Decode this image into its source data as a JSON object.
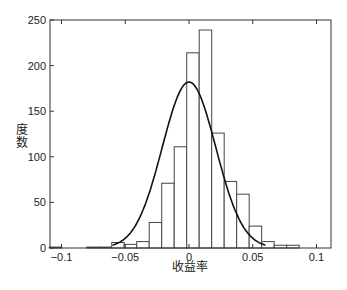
{
  "chart_data": {
    "type": "bar",
    "subtype": "histogram_with_normal_fit",
    "title": "",
    "xlabel": "收益率",
    "ylabel": "度数",
    "xlim": [
      -0.11,
      0.11
    ],
    "ylim": [
      0,
      250
    ],
    "xticks": [
      -0.1,
      -0.05,
      0,
      0.05,
      0.1
    ],
    "xtick_labels": [
      "−0.1",
      "−0.05",
      "0",
      "0.05",
      "0.1"
    ],
    "yticks": [
      0,
      50,
      100,
      150,
      200,
      250
    ],
    "ytick_labels": [
      "0",
      "50",
      "100",
      "150",
      "200",
      "250"
    ],
    "grid": false,
    "bin_width": 0.0098,
    "bins": [
      {
        "center": -0.1047,
        "count": 1
      },
      {
        "center": -0.0753,
        "count": 1
      },
      {
        "center": -0.0655,
        "count": 1
      },
      {
        "center": -0.0557,
        "count": 6
      },
      {
        "center": -0.0459,
        "count": 4
      },
      {
        "center": -0.0361,
        "count": 7
      },
      {
        "center": -0.0263,
        "count": 28
      },
      {
        "center": -0.0165,
        "count": 71
      },
      {
        "center": -0.0067,
        "count": 111
      },
      {
        "center": 0.0031,
        "count": 214
      },
      {
        "center": 0.0129,
        "count": 239
      },
      {
        "center": 0.0227,
        "count": 126
      },
      {
        "center": 0.0325,
        "count": 73
      },
      {
        "center": 0.0423,
        "count": 59
      },
      {
        "center": 0.0521,
        "count": 24
      },
      {
        "center": 0.0619,
        "count": 7
      },
      {
        "center": 0.0717,
        "count": 3
      },
      {
        "center": 0.0815,
        "count": 3
      }
    ],
    "fit_curve": {
      "type": "normal",
      "mean": 0.0,
      "peak": 182,
      "sigma": 0.021
    }
  }
}
